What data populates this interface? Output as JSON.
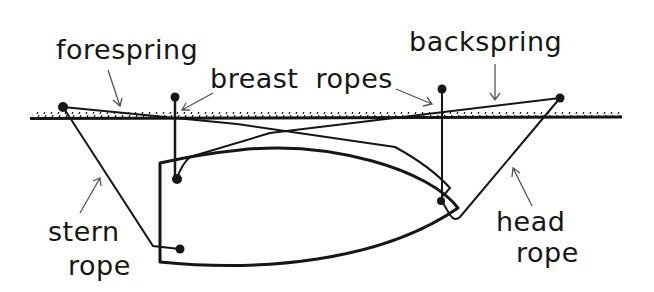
{
  "diagram": {
    "type": "mooring-lines",
    "labels": {
      "forespring": "forespring",
      "breast_ropes": "breast ropes",
      "backspring": "backspring",
      "stern_rope_line1": "stern",
      "stern_rope_line2": "rope",
      "head_rope_line1": "head",
      "head_rope_line2": "rope"
    },
    "elements": [
      "quay",
      "boat",
      "bollards",
      "forespring",
      "backspring",
      "breast ropes",
      "stern rope",
      "head rope"
    ],
    "colors": {
      "ink": "#161616",
      "background": "#ffffff",
      "arrow": "#555555"
    }
  }
}
